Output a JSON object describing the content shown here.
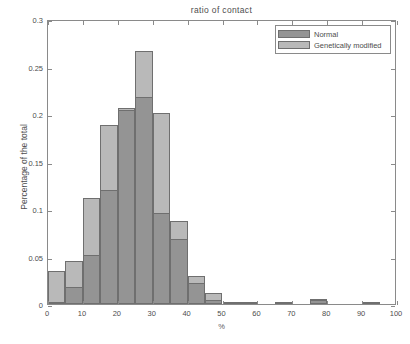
{
  "chart_data": {
    "type": "bar",
    "title": "ratio of contact",
    "xlabel": "%",
    "ylabel": "Percentage of the total",
    "xlim": [
      0,
      100
    ],
    "ylim": [
      0,
      0.3
    ],
    "grid": false,
    "legend_position": "top-right",
    "bin_width": 5,
    "bin_starts": [
      0,
      5,
      10,
      15,
      20,
      25,
      30,
      35,
      40,
      45,
      50,
      55,
      60,
      65,
      70,
      75,
      80,
      85,
      90,
      95
    ],
    "xticks": [
      0,
      10,
      20,
      30,
      40,
      50,
      60,
      70,
      80,
      90,
      100
    ],
    "xtick_labels": [
      "0",
      "10",
      "20",
      "30",
      "40",
      "50",
      "60",
      "70",
      "80",
      "90",
      "100"
    ],
    "yticks": [
      0,
      0.05,
      0.1,
      0.15,
      0.2,
      0.25,
      0.3
    ],
    "ytick_labels": [
      "0",
      "0.05",
      "0.1",
      "0.15",
      "0.2",
      "0.25",
      "0.3"
    ],
    "series": [
      {
        "name": "Normal",
        "color": "#949494",
        "values": [
          0.002,
          0.018,
          0.052,
          0.12,
          0.204,
          0.218,
          0.096,
          0.068,
          0.022,
          0.004,
          0.001,
          0.001,
          0.0,
          0.001,
          0.0,
          0.004,
          0.0,
          0.0,
          0.001,
          0.0
        ]
      },
      {
        "name": "Genetically modified",
        "color": "#b9b9b9",
        "values": [
          0.035,
          0.045,
          0.112,
          0.188,
          0.206,
          0.266,
          0.201,
          0.087,
          0.029,
          0.012,
          0.001,
          0.001,
          0.0,
          0.001,
          0.0,
          0.005,
          0.0,
          0.0,
          0.001,
          0.0
        ]
      }
    ]
  },
  "legend": {
    "items": [
      {
        "label": "Normal"
      },
      {
        "label": "Genetically modified"
      }
    ]
  },
  "colors": {
    "axis": "#8a8a8a",
    "text": "#4d4d4d",
    "background": "#ffffff",
    "bar_normal": "#949494",
    "bar_gm": "#b9b9b9",
    "bar_edge": "#6f6f6f"
  }
}
